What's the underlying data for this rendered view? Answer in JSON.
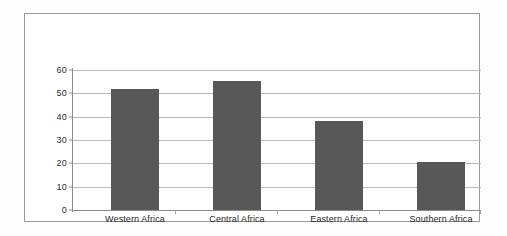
{
  "chart_data": {
    "type": "bar",
    "title": "",
    "subtitle": "",
    "xlabel": "",
    "ylabel": "",
    "categories": [
      "Western Africa",
      "Central Africa",
      "Eastern Africa",
      "Southern Africa"
    ],
    "values": [
      52,
      55.5,
      38,
      20.5
    ],
    "series": [
      {
        "name": "",
        "values": [
          52,
          55.5,
          38,
          20.5
        ]
      }
    ],
    "ylim": [
      0,
      60
    ],
    "ytick_labels": [
      "60",
      "50",
      "40",
      "30",
      "20",
      "10",
      "0"
    ],
    "ytick_values": [
      60,
      50,
      40,
      30,
      20,
      10,
      0
    ],
    "ytick_step": 10,
    "grid": true,
    "grid_axis": "y",
    "legend": false,
    "legend_position": "none",
    "bar_color": "#585858",
    "grid_color": "#b9b9b9",
    "axis_color": "#8c8c8c",
    "frame_color": "#9a9a9a",
    "background_color": "#ffffff",
    "annotations": []
  }
}
